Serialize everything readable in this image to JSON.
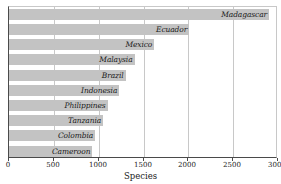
{
  "chart_data": {
    "type": "bar",
    "orientation": "horizontal",
    "title": "",
    "xlabel": "Species",
    "ylabel": "",
    "xlim": [
      0,
      3000
    ],
    "xticks": [
      0,
      500,
      1000,
      1500,
      2000,
      2500,
      3000
    ],
    "xtick_labels": [
      "0",
      "500",
      "1000",
      "1500",
      "2000",
      "2500",
      "3000"
    ],
    "grid": true,
    "legend": false,
    "categories": [
      "Madagascar",
      "Ecuador",
      "Mexico",
      "Malaysia",
      "Brazil",
      "Indonesia",
      "Philippines",
      "Tanzania",
      "Colombia",
      "Cameroon"
    ],
    "values": [
      2900,
      2010,
      1620,
      1400,
      1300,
      1230,
      1100,
      1050,
      960,
      930
    ],
    "bar_color": "#c3c3c3",
    "grid_color": "#c8c8c8",
    "axis_color": "#4a4a4a",
    "label_color": "#1a1a1a"
  },
  "title_remnant": "",
  "axis": {
    "x_title": "Species"
  }
}
